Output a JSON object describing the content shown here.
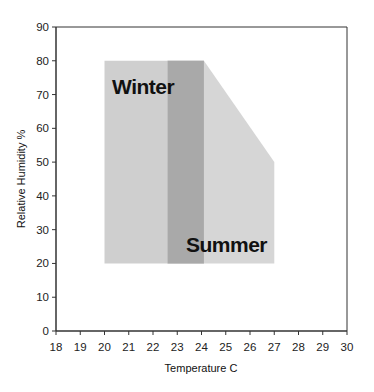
{
  "chart_data": {
    "type": "area",
    "title": "",
    "xlabel": "Temperature C",
    "ylabel": "Relative Humidity %",
    "xlim": [
      18,
      30
    ],
    "ylim": [
      0,
      90
    ],
    "x_ticks": [
      18,
      19,
      20,
      21,
      22,
      23,
      24,
      25,
      26,
      27,
      28,
      29,
      30
    ],
    "y_ticks": [
      0,
      10,
      20,
      30,
      40,
      50,
      60,
      70,
      80,
      90
    ],
    "grid": false,
    "legend": null,
    "regions": [
      {
        "name": "Winter",
        "shape": "polygon",
        "points": [
          [
            20,
            20
          ],
          [
            20,
            80
          ],
          [
            24.1,
            80
          ],
          [
            24.1,
            20
          ]
        ],
        "color": "#cfcfcf"
      },
      {
        "name": "Summer",
        "shape": "polygon",
        "points": [
          [
            22.6,
            20
          ],
          [
            22.6,
            80
          ],
          [
            24.1,
            80
          ],
          [
            27,
            50
          ],
          [
            27,
            20
          ]
        ],
        "color": "#d6d6d6"
      },
      {
        "name": "Overlap",
        "shape": "polygon",
        "points": [
          [
            22.6,
            20
          ],
          [
            22.6,
            80
          ],
          [
            24.1,
            80
          ],
          [
            24.1,
            20
          ]
        ],
        "color": "#a9a9a9"
      }
    ],
    "annotations": [
      {
        "text": "Winter",
        "x": 20.3,
        "y": 73
      },
      {
        "text": "Summer",
        "x": 23.2,
        "y": 26
      }
    ]
  },
  "labels": {
    "xlabel": "Temperature C",
    "ylabel": "Relative Humidity %",
    "winter": "Winter",
    "summer": "Summer",
    "x_ticks": [
      "18",
      "19",
      "20",
      "21",
      "22",
      "23",
      "24",
      "25",
      "26",
      "27",
      "28",
      "29",
      "30"
    ],
    "y_ticks": [
      "0",
      "10",
      "20",
      "30",
      "40",
      "50",
      "60",
      "70",
      "80",
      "90"
    ]
  },
  "colors": {
    "winter": "#cfcfcf",
    "summer": "#d6d6d6",
    "overlap": "#a9a9a9",
    "axis": "#333333"
  }
}
